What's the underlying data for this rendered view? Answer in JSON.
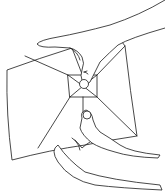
{
  "illustration": {
    "description": "Line drawing of two hands folding a square sheet of paper; thumbs pinch the center where crease lines meet around a small central square",
    "style": "black ink line art on white",
    "colors": {
      "background": "#ffffff",
      "ink": "#1a1a1a"
    },
    "elements": [
      "paper-sheet",
      "crease-lines",
      "center-square",
      "upper-hand",
      "lower-hand",
      "thumb-upper",
      "thumb-lower"
    ]
  }
}
